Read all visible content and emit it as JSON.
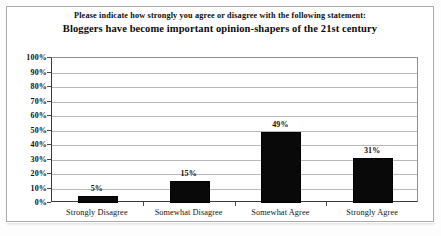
{
  "chart_data": {
    "type": "bar",
    "title": "Please indicate how strongly you agree or disagree with the following statement:\nBloggers have become important opinion-shapers of the 21st century",
    "title_line1": "Please indicate how strongly you agree or disagree with the following statement:",
    "title_line2": "Bloggers have become important opinion-shapers of the 21st century",
    "categories": [
      "Strongly Disagree",
      "Somewhat Disagree",
      "Somewhat Agree",
      "Strongly Agree"
    ],
    "values": [
      5,
      15,
      49,
      31
    ],
    "value_labels": [
      "5%",
      "15%",
      "49%",
      "31%"
    ],
    "xlabel": "",
    "ylabel": "",
    "ylim": [
      0,
      100
    ],
    "ytick_labels": [
      "100%",
      "90%",
      "80%",
      "70%",
      "60%",
      "50%",
      "40%",
      "30%",
      "20%",
      "10%",
      "0%"
    ],
    "ytick_values": [
      100,
      90,
      80,
      70,
      60,
      50,
      40,
      30,
      20,
      10,
      0
    ],
    "grid": true,
    "legend": false,
    "bar_color": "#090909",
    "grid_color": "#b9b9b9",
    "axis_color": "#3a3a3a",
    "text_color": "#111111",
    "background": "#ffffff"
  }
}
